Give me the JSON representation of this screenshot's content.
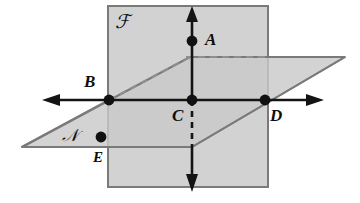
{
  "figure": {
    "width": 360,
    "height": 203,
    "background": "#ffffff"
  },
  "colors": {
    "plane_fill": "#d0d0d0",
    "plane_fill_overlap": "#c2c2c2",
    "plane_edge": "#7a7a7a",
    "line_solid": "#121212",
    "line_hidden": "#9a9a9a",
    "point_fill": "#111111",
    "label_color": "#0d0d0d"
  },
  "planes": [
    {
      "id": "plane-f",
      "label": "ℱ",
      "name": "vertical-plane-F",
      "shape": "rectangle",
      "label_x": 118,
      "label_y": 17
    },
    {
      "id": "plane-n",
      "label": "𝒩",
      "name": "horizontal-plane-N",
      "shape": "parallelogram",
      "label_x": 64,
      "label_y": 129
    }
  ],
  "points": [
    {
      "id": "A",
      "label": "A",
      "x": 192,
      "y": 41,
      "label_x": 203,
      "label_y": 31
    },
    {
      "id": "B",
      "label": "B",
      "x": 109,
      "y": 100,
      "label_x": 85,
      "label_y": 72
    },
    {
      "id": "C",
      "label": "C",
      "x": 192,
      "y": 100,
      "label_x": 173,
      "label_y": 106
    },
    {
      "id": "D",
      "label": "D",
      "x": 265,
      "y": 100,
      "label_x": 270,
      "label_y": 106
    },
    {
      "id": "E",
      "label": "E",
      "x": 101,
      "y": 137,
      "label_x": 92,
      "label_y": 150
    }
  ],
  "lines": [
    {
      "id": "horizontal-line",
      "name": "line-BD-horizontal",
      "style": "solid",
      "arrows": "both"
    },
    {
      "id": "vertical-line",
      "name": "line-AC-vertical",
      "style": "solid-with-hidden-segment",
      "arrows": "both"
    },
    {
      "id": "hidden-back-edge",
      "name": "plane-N-back-edge",
      "style": "dashed",
      "arrows": "none"
    }
  ]
}
